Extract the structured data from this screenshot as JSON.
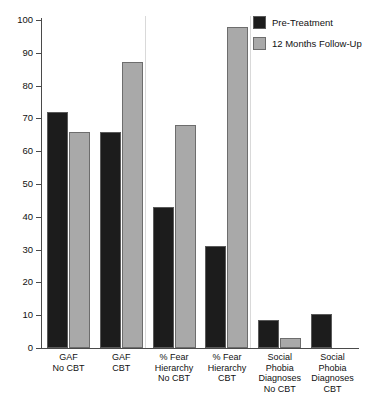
{
  "chart_data": {
    "type": "bar",
    "title": "",
    "subtitle": "",
    "xlabel": "",
    "ylabel": "",
    "ylim": [
      0,
      100
    ],
    "yticks": [
      0,
      10,
      20,
      30,
      40,
      50,
      60,
      70,
      80,
      90,
      100
    ],
    "grid": false,
    "legend_position": "top-right",
    "categories": [
      "GAF\nNo CBT",
      "GAF\nCBT",
      "% Fear\nHierarchy\nNo CBT",
      "% Fear\nHierarchy\nCBT",
      "Social\nPhobia\nDiagnoses\nNo CBT",
      "Social\nPhobia\nDiagnoses\nCBT"
    ],
    "series": [
      {
        "name": "Pre-Treatment",
        "color": "#1c1c1c",
        "values": [
          72,
          66,
          43,
          31,
          8.5,
          10.5
        ]
      },
      {
        "name": "12 Months Follow-Up",
        "color": "#a9a9a9",
        "values": [
          65.8,
          87.2,
          68,
          98,
          3.2,
          0
        ]
      }
    ],
    "group_separators_after": [
      2,
      4
    ],
    "annotations": []
  },
  "legend": {
    "items": [
      {
        "label": "Pre-Treatment",
        "swatch": "pre"
      },
      {
        "label": "12 Months Follow-Up",
        "swatch": "post"
      }
    ]
  },
  "axis": {
    "y_tick_labels": [
      "100",
      "90",
      "80",
      "70",
      "60",
      "50",
      "40",
      "30",
      "20",
      "10",
      "0"
    ]
  }
}
